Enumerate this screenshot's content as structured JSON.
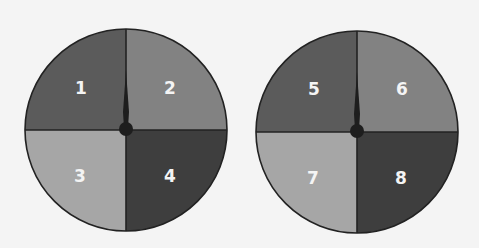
{
  "colors": {
    "background": "#f4f4f4",
    "quadrant_top_left": "#5b5b5b",
    "quadrant_top_right": "#828282",
    "quadrant_bottom_left": "#a6a6a6",
    "quadrant_bottom_right": "#3e3e3e",
    "outline": "#222222",
    "label": "#f4f4f4"
  },
  "spinners": [
    {
      "name": "spinner-left",
      "labels": [
        "1",
        "2",
        "3",
        "4"
      ]
    },
    {
      "name": "spinner-right",
      "labels": [
        "5",
        "6",
        "7",
        "8"
      ]
    }
  ]
}
